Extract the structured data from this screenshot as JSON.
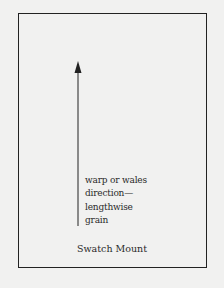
{
  "diagram": {
    "frame_label": "Swatch Mount",
    "arrow_label_lines": [
      "warp or wales",
      "direction—",
      "lengthwise",
      "grain"
    ],
    "arrow_direction": "up-arrow",
    "colors": {
      "background": "#f1f1f0",
      "stroke": "#222222",
      "text": "#2a2a2a"
    }
  }
}
